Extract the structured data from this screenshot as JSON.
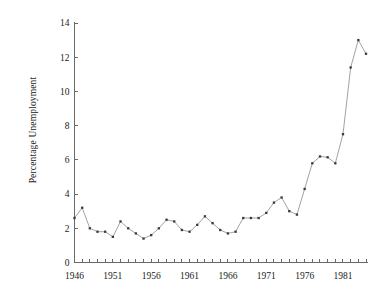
{
  "figure": {
    "background_color": "#ffffff",
    "line_color": "#8a8a8a",
    "marker_color": "#3a3a3a",
    "axis_color": "#6a6a6a"
  },
  "chart_data": {
    "type": "line",
    "title": "",
    "subtitle": "",
    "xlabel": "",
    "ylabel": "Percentage Unemployment",
    "xlim": [
      1946,
      1984
    ],
    "ylim": [
      0,
      14
    ],
    "grid": false,
    "legend": false,
    "legend_position": "none",
    "x_tick_labels": [
      "1946",
      "1951",
      "1956",
      "1961",
      "1966",
      "1971",
      "1976",
      "1981"
    ],
    "x_tick_values": [
      1946,
      1951,
      1956,
      1961,
      1966,
      1971,
      1976,
      1981
    ],
    "x_minor_tick_step": 1,
    "y_tick_labels": [
      "0",
      "2",
      "4",
      "6",
      "8",
      "10",
      "12",
      "14"
    ],
    "y_tick_values": [
      0,
      2,
      4,
      6,
      8,
      10,
      12,
      14
    ],
    "marker": "square",
    "series": [
      {
        "name": "Percentage Unemployment",
        "x": [
          1946,
          1947,
          1948,
          1949,
          1950,
          1951,
          1952,
          1953,
          1954,
          1955,
          1956,
          1957,
          1958,
          1959,
          1960,
          1961,
          1962,
          1963,
          1964,
          1965,
          1966,
          1967,
          1968,
          1969,
          1970,
          1971,
          1972,
          1973,
          1974,
          1975,
          1976,
          1977,
          1978,
          1979,
          1980,
          1981,
          1982,
          1983,
          1984
        ],
        "values": [
          2.6,
          3.2,
          2.0,
          1.8,
          1.8,
          1.5,
          2.4,
          2.0,
          1.7,
          1.4,
          1.6,
          2.0,
          2.5,
          2.4,
          1.9,
          1.8,
          2.2,
          2.7,
          2.3,
          1.9,
          1.7,
          1.8,
          2.6,
          2.6,
          2.6,
          2.9,
          3.5,
          3.8,
          3.0,
          2.8,
          4.3,
          5.8,
          6.2,
          6.15,
          5.8,
          7.5,
          11.4,
          13.0,
          12.2
        ]
      }
    ],
    "annotations": []
  }
}
